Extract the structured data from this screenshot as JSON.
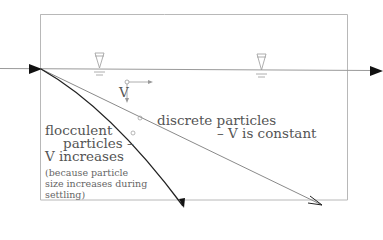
{
  "diagram": {
    "labels": {
      "velocity_symbol": "V",
      "discrete_line1": "discrete particles",
      "discrete_line2": "– V is constant",
      "flocculent_line1": "flocculent",
      "flocculent_line2": "particles –",
      "flocculent_line3": "V increases",
      "note_line1": "(because particle",
      "note_line2": "size increases during",
      "note_line3": "settling)"
    },
    "elements": {
      "tank_outline": "rectangle",
      "water_surface": "horizontal flow line with arrows",
      "water_level_markers": 2,
      "discrete_path": "straight line",
      "flocculent_path": "curved line (steepening)"
    },
    "colors": {
      "outline": "#b0b0b0",
      "flow_line": "#9a9a9a",
      "discrete_path": "#7a7a7a",
      "flocculent_path": "#222222",
      "arrowhead": "#111111",
      "text": "#555555"
    }
  }
}
